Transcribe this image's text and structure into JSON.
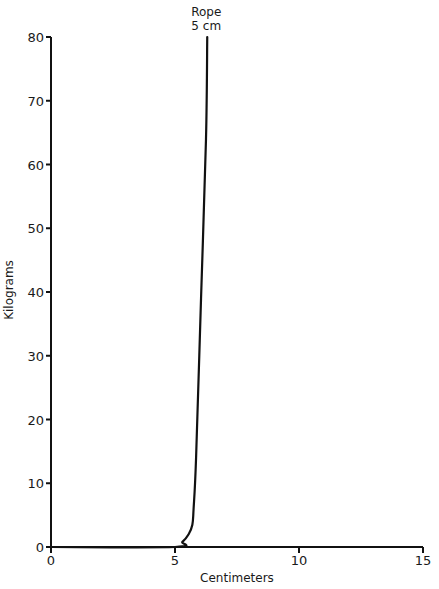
{
  "chart_data": {
    "type": "line",
    "title": "",
    "xlabel": "Centimeters",
    "ylabel": "Kilograms",
    "xlim": [
      0,
      15
    ],
    "ylim": [
      0,
      80
    ],
    "xticks": [
      0,
      5,
      10,
      15
    ],
    "yticks": [
      0,
      10,
      20,
      30,
      40,
      50,
      60,
      70,
      80
    ],
    "grid": false,
    "legend": null,
    "annotations": [
      {
        "text": [
          "Rope",
          "5 cm"
        ],
        "x": 6.3,
        "y": 80,
        "position": "above line end"
      }
    ],
    "series": [
      {
        "name": "Rope 5 cm",
        "x": [
          0,
          5.0,
          5.3,
          5.55,
          5.7,
          5.75,
          5.85,
          6.05,
          6.25,
          6.3
        ],
        "y": [
          0,
          0,
          0.8,
          2.0,
          3.5,
          6,
          14,
          39,
          64,
          80
        ]
      }
    ]
  },
  "labels": {
    "annotation_line1": "Rope",
    "annotation_line2": "5 cm",
    "xlabel": "Centimeters",
    "ylabel": "Kilograms"
  }
}
